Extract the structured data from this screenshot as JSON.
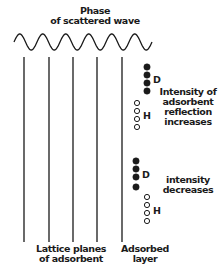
{
  "title": {
    "line1": "Phase",
    "line2": "of scattered wave"
  },
  "wave": {
    "x_start": 14,
    "x_end": 152,
    "y_center": 42,
    "amplitude": 8,
    "cycles": 6
  },
  "lattice_planes": {
    "x_positions": [
      24,
      49,
      73,
      97
    ],
    "y_top": 57,
    "y_bottom": 242,
    "label_line1": "Lattice planes",
    "label_line2": "of adsorbent"
  },
  "adsorbed_layer": {
    "x": 122,
    "y_top": 57,
    "y_bottom": 242,
    "label_line1": "Adsorbed",
    "label_line2": "layer"
  },
  "group_top": {
    "D": {
      "label": "D",
      "x": 147,
      "y": [
        67,
        75,
        83,
        91
      ],
      "filled": true
    },
    "H": {
      "label": "H",
      "x": 137,
      "y": [
        103,
        111,
        119,
        127
      ],
      "filled": false
    },
    "annotation": [
      "Intensity of",
      "adsorbent",
      "reflection",
      "increases"
    ]
  },
  "group_bottom": {
    "D": {
      "label": "D",
      "x": 136,
      "y": [
        161,
        169,
        177,
        187
      ],
      "filled": true
    },
    "H": {
      "label": "H",
      "x": 147,
      "y": [
        197,
        205,
        213,
        221
      ],
      "filled": false
    },
    "annotation": [
      "intensity",
      "decreases"
    ]
  },
  "colors": {
    "ink": "#1a1a1a",
    "background": "#ffffff"
  }
}
